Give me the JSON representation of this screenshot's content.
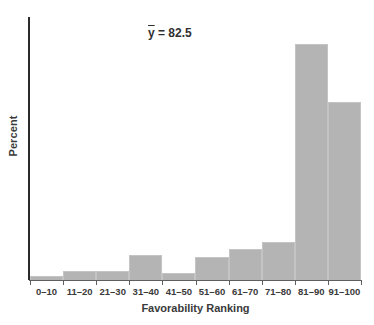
{
  "chart_data": {
    "type": "bar",
    "title": "",
    "subtitle": "",
    "xlabel": "Favorability Ranking",
    "ylabel": "Percent",
    "categories": [
      "0–10",
      "11–20",
      "21–30",
      "31–40",
      "41–50",
      "51–60",
      "61–70",
      "71–80",
      "81–90",
      "91–100"
    ],
    "values": [
      0.6,
      1.4,
      1.4,
      3.7,
      1.0,
      3.4,
      4.6,
      5.7,
      35.1,
      26.5
    ],
    "bar_pixel_heights": [
      4,
      9,
      9,
      25,
      7,
      23,
      31,
      38,
      236,
      178
    ],
    "series": [
      {
        "name": "Percent",
        "values": [
          0.6,
          1.4,
          1.4,
          3.7,
          1.0,
          3.4,
          4.6,
          5.7,
          35.1,
          26.5
        ]
      }
    ],
    "ylim": [
      0,
      40
    ],
    "y_ticks_shown": false,
    "grid": false,
    "legend": false,
    "legend_position": "none",
    "bar_color": "#b4b4b4",
    "axis_color": "#2b2b2b",
    "annotations": [
      {
        "name": "mean-label",
        "symbol": "ȳ",
        "equals": " = ",
        "value": "82.5",
        "full_text": "ȳ = 82.5"
      }
    ]
  },
  "annotation": {
    "symbol": "y",
    "equals": "= 82.5"
  },
  "axes": {
    "y_title": "Percent",
    "x_title": "Favorability Ranking"
  }
}
